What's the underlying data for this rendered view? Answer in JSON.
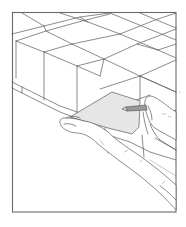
{
  "caption": {
    "text": ""
  },
  "illustration": {
    "description": "Line drawing of a stack of blocks/tiles in a frame; a left hand holds a flat card tool against the block face while a right hand marks with a pencil",
    "frame": {
      "x": 12,
      "y": 12,
      "width": 164,
      "height": 200
    },
    "colors": {
      "line": "#5a5a5a",
      "frame": "#6a6a6a",
      "card_fill": "#e6e6e6",
      "background": "#ffffff"
    }
  }
}
